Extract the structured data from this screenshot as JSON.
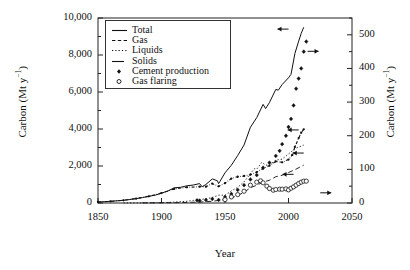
{
  "chart_data": {
    "type": "line",
    "title": "",
    "xlabel": "Year",
    "ylabel": "Carbon (Mt y⁻¹)",
    "ylabel_right": "Carbon (Mt y⁻¹)",
    "xlim": [
      1850,
      2050
    ],
    "ylim": [
      0,
      10000
    ],
    "ylim_right": [
      0,
      550
    ],
    "xticks": [
      1850,
      1900,
      1950,
      2000,
      2050
    ],
    "xticklabels": [
      "1850",
      "1900",
      "1950",
      "2000",
      "2050"
    ],
    "yticks": [
      0,
      2000,
      4000,
      6000,
      8000,
      10000
    ],
    "yticklabels": [
      "0",
      "2,000",
      "4,000",
      "6,000",
      "8,000",
      "10,000"
    ],
    "yticks_minor": [
      1000,
      3000,
      5000,
      7000,
      9000
    ],
    "yticks_right": [
      0,
      100,
      200,
      300,
      400,
      500
    ],
    "yticklabels_right": [
      "0",
      "100",
      "200",
      "300",
      "400",
      "500"
    ],
    "yticks_right_minor": [
      50,
      150,
      250,
      350,
      450,
      550
    ],
    "grid": false,
    "legend_position": "upper-left-inside",
    "legend": [
      {
        "label": "Total",
        "style": "solid",
        "axis": "left"
      },
      {
        "label": "Gas",
        "style": "dashed",
        "axis": "left"
      },
      {
        "label": "Liquids",
        "style": "dotted",
        "axis": "left"
      },
      {
        "label": "Solids",
        "style": "dashdot",
        "axis": "left"
      },
      {
        "label": "Cement production",
        "style": "filled-diamond-markers",
        "axis": "right"
      },
      {
        "label": "Gas flaring",
        "style": "open-circle-markers",
        "axis": "right"
      }
    ],
    "annotations": [
      {
        "text": "←",
        "series": "Total",
        "points_to": "left-axis",
        "x": 2000,
        "y": 9400
      },
      {
        "text": "→",
        "series": "Cement production",
        "points_to": "right-axis",
        "x": 2015,
        "y": 8200
      },
      {
        "text": "←",
        "series": "Solids",
        "points_to": "left-axis",
        "x": 2008,
        "y": 3950
      },
      {
        "text": "←",
        "series": "Liquids",
        "points_to": "left-axis",
        "x": 2012,
        "y": 2700
      },
      {
        "text": "←",
        "series": "Gas",
        "points_to": "left-axis",
        "x": 2004,
        "y": 1550
      },
      {
        "text": "→",
        "series": "Gas flaring",
        "points_to": "right-axis",
        "x": 2025,
        "y": 550
      }
    ],
    "series": [
      {
        "name": "Total",
        "axis": "left",
        "x": [
          1850,
          1855,
          1860,
          1865,
          1870,
          1875,
          1880,
          1885,
          1890,
          1895,
          1900,
          1905,
          1910,
          1915,
          1920,
          1925,
          1930,
          1932,
          1935,
          1940,
          1944,
          1945,
          1946,
          1950,
          1955,
          1960,
          1965,
          1970,
          1975,
          1980,
          1982,
          1985,
          1990,
          1992,
          1995,
          2000,
          2002,
          2005,
          2008,
          2010,
          2012
        ],
        "y": [
          54,
          70,
          92,
          118,
          147,
          190,
          236,
          290,
          360,
          420,
          534,
          650,
          820,
          850,
          930,
          975,
          1050,
          880,
          1000,
          1300,
          1200,
          1050,
          1160,
          1630,
          2040,
          2570,
          3130,
          4090,
          4620,
          5330,
          5100,
          5440,
          6140,
          6100,
          6400,
          6770,
          6950,
          8080,
          8750,
          9170,
          9500
        ]
      },
      {
        "name": "Gas",
        "axis": "left",
        "x": [
          1885,
          1900,
          1910,
          1920,
          1930,
          1940,
          1950,
          1955,
          1960,
          1965,
          1970,
          1975,
          1980,
          1985,
          1990,
          1995,
          2000,
          2005,
          2010,
          2012
        ],
        "y": [
          3,
          9,
          18,
          30,
          50,
          90,
          190,
          260,
          420,
          570,
          830,
          960,
          1130,
          1230,
          1420,
          1500,
          1650,
          1800,
          1980,
          2050
        ]
      },
      {
        "name": "Liquids",
        "axis": "left",
        "x": [
          1870,
          1880,
          1890,
          1900,
          1910,
          1920,
          1925,
          1930,
          1935,
          1940,
          1945,
          1950,
          1955,
          1960,
          1965,
          1970,
          1973,
          1975,
          1979,
          1982,
          1985,
          1990,
          1995,
          2000,
          2005,
          2010,
          2012
        ],
        "y": [
          1,
          4,
          10,
          18,
          48,
          94,
          140,
          190,
          220,
          300,
          420,
          420,
          650,
          850,
          1140,
          1580,
          1850,
          1830,
          2200,
          2050,
          2050,
          2320,
          2370,
          2650,
          2940,
          3070,
          3130
        ]
      },
      {
        "name": "Solids",
        "axis": "left",
        "x": [
          1850,
          1860,
          1870,
          1880,
          1890,
          1900,
          1910,
          1920,
          1930,
          1935,
          1940,
          1945,
          1950,
          1955,
          1960,
          1965,
          1970,
          1975,
          1980,
          1985,
          1990,
          1995,
          2000,
          2003,
          2005,
          2008,
          2010,
          2012
        ],
        "y": [
          54,
          91,
          147,
          236,
          360,
          534,
          760,
          850,
          880,
          880,
          1050,
          900,
          1070,
          1320,
          1420,
          1460,
          1530,
          1670,
          1860,
          2020,
          2250,
          2200,
          2350,
          2600,
          3030,
          3510,
          3800,
          3980
        ]
      },
      {
        "name": "Cement production",
        "axis": "right",
        "x": [
          1928,
          1930,
          1935,
          1940,
          1945,
          1950,
          1955,
          1960,
          1965,
          1970,
          1975,
          1980,
          1985,
          1990,
          1993,
          1995,
          1998,
          2000,
          2002,
          2004,
          2006,
          2008,
          2010,
          2012,
          2014
        ],
        "y": [
          8,
          7,
          9,
          12,
          9,
          18,
          27,
          39,
          53,
          70,
          83,
          105,
          120,
          140,
          155,
          175,
          200,
          226,
          250,
          290,
          340,
          370,
          400,
          450,
          480
        ]
      },
      {
        "name": "Gas flaring",
        "axis": "right",
        "x": [
          1950,
          1955,
          1960,
          1965,
          1970,
          1975,
          1978,
          1980,
          1983,
          1985,
          1988,
          1990,
          1993,
          1995,
          1998,
          2000,
          2002,
          2004,
          2006,
          2008,
          2010,
          2012,
          2014
        ],
        "y": [
          10,
          18,
          25,
          35,
          53,
          62,
          66,
          60,
          50,
          43,
          38,
          40,
          41,
          41,
          42,
          39,
          44,
          48,
          53,
          58,
          62,
          65,
          65
        ]
      }
    ]
  }
}
